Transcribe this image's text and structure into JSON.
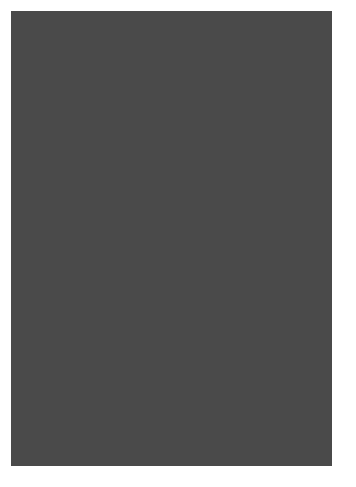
{
  "chart": {
    "columns": 24,
    "rows_count": 34,
    "palette": {
      "W": "#ffffff",
      "L": "#d8d8d8",
      "M": "#a8a8a8",
      "D": "#8c8c8c",
      "X": "#707070"
    },
    "rows_top_to_bottom": [
      {
        "row": 34,
        "cells": "DDDDDDDDDDDDDDDDDDDDDDDD"
      },
      {
        "row": 33,
        "cells": "WDWDWDWDWDWDWDWDWDWDWDWD"
      },
      {
        "row": 32,
        "cells": "WWWWWWWWWWWWWWWWWWWWWWWW"
      },
      {
        "row": 31,
        "cells": "DWWWDWDWWWDWWWWDDDDDWWWD"
      },
      {
        "row": 30,
        "cells": "MMWWMWMWWWMMWWMWMMMWMWWW"
      },
      {
        "row": 29,
        "cells": "WMMWMWMWMMWMWMWWWMWWWMWW"
      },
      {
        "row": 28,
        "cells": "LLMMMLMMMLLMMLLLMLMLLLML"
      },
      {
        "row": 27,
        "cells": "LLLMMLMMLLLMMMLMLLLMLMML"
      },
      {
        "row": 26,
        "cells": "XLLLXXXLLLXXLXXLLXLLXXLX"
      },
      {
        "row": 25,
        "cells": "LLLMMLMMLLLMMMLMLLLMLMML"
      },
      {
        "row": 24,
        "cells": "LLMMMLMMMLLMMLLLMLMLLLML"
      },
      {
        "row": 23,
        "cells": "WMMWMWMWMMWMWMWWWMWWWMWW"
      },
      {
        "row": 22,
        "cells": "MMWWMWMWWWMMWWMWMMMWMWWW"
      },
      {
        "row": 21,
        "cells": "MWWWMWMWWWMMWWWMMMMMWWWM"
      },
      {
        "row": 20,
        "cells": "WWWWWWWWWWWWWWWWWWWWWWWW"
      },
      {
        "row": 19,
        "cells": "WDWDWDWDWDWDWDWDWDWDWDWD"
      },
      {
        "row": 18,
        "cells": "DDDDDDDDDDDDDDDDDDDDDDDD"
      },
      {
        "row": 17,
        "cells": "DDDDDDDDDDDDDDDDDDDDDDDD"
      },
      {
        "row": 16,
        "cells": "DLDLDLDLDLDLDLDLDLDLDLDL"
      },
      {
        "row": 15,
        "cells": "LLLLLLLLLLLLLLLLLLLLLLLL"
      },
      {
        "row": 14,
        "cells": "LLLMMMMMLLLMMLLLMMMLLLMM"
      },
      {
        "row": 13,
        "cells": "WWMWWMWWMWWWMMWWWMWWWMMW"
      },
      {
        "row": 12,
        "cells": "WMWWMMMWWMWWWMMWWMWWMMWW"
      },
      {
        "row": 11,
        "cells": "MWWMMWMMWWMWWWMMWMWMMWWW"
      },
      {
        "row": 10,
        "cells": "MWMMWWWMMWMWWWWMMMMMWWWW"
      },
      {
        "row": 9,
        "cells": "XXXLXXXLXXXLLLLLXLXLLLLL"
      },
      {
        "row": 8,
        "cells": "MWMMWWWMMWMWWWWMMMMMWWWW"
      },
      {
        "row": 7,
        "cells": "MWWMMWMMWWMWWWMMWMWMMWWW"
      },
      {
        "row": 6,
        "cells": "WMWWMMMWWMWWWMMWWMWWMMWW"
      },
      {
        "row": 5,
        "cells": "WWMWWMWWMWWWMMWWWMWWWMMW"
      },
      {
        "row": 4,
        "cells": "LLLDDDDDLLLDDLLLDDDLLLDD"
      },
      {
        "row": 3,
        "cells": "LLLLLLLLLLLLLLLLLLLLLLLL"
      },
      {
        "row": 2,
        "cells": "DLDLDLDLDLDLDLDLDLDLDLDL"
      },
      {
        "row": 1,
        "cells": "DDDDDDDDDDDDDDDDDDDDDDDD"
      }
    ],
    "row_labels": [
      {
        "text": "34",
        "row": 34
      },
      {
        "text": "30",
        "row": 30
      },
      {
        "text": "25",
        "row": 25
      },
      {
        "text": "20",
        "row": 20
      },
      {
        "text": "15",
        "row": 15
      },
      {
        "text": "10",
        "row": 10
      },
      {
        "text": "5",
        "row": 5
      },
      {
        "text": "1",
        "row": 1
      }
    ],
    "col_labels": [
      {
        "text": "24",
        "x": 13
      },
      {
        "text": "20",
        "x": 66
      },
      {
        "text": "15",
        "x": 133
      },
      {
        "text": "10",
        "x": 200
      },
      {
        "text": "5",
        "x": 270
      },
      {
        "text": "1",
        "x": 323
      }
    ]
  }
}
